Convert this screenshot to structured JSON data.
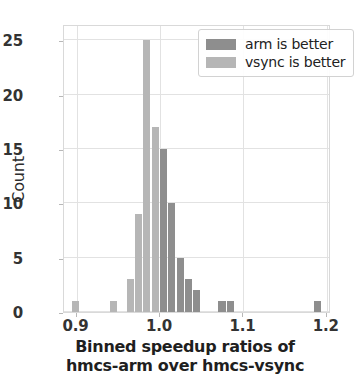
{
  "chart_data": {
    "type": "bar",
    "title": "",
    "subtitle": "",
    "xlabel_line1": "Binned speedup ratios of",
    "xlabel_line2": "hmcs-arm over hmcs-vsync",
    "ylabel": "Count",
    "xlim": [
      0.885,
      1.205
    ],
    "ylim": [
      0,
      26.5
    ],
    "xticks": [
      0.9,
      1.0,
      1.1,
      1.2
    ],
    "xtick_labels": [
      "0.9",
      "1.0",
      "1.1",
      "1.2"
    ],
    "yticks": [
      0,
      5,
      10,
      15,
      20,
      25
    ],
    "ytick_labels": [
      "0",
      "5",
      "10",
      "15",
      "20",
      "25"
    ],
    "grid": true,
    "legend_position": "upper right",
    "bin_width": 0.01,
    "threshold": 1.0,
    "series": [
      {
        "name": "vsync is better",
        "color": "#b6b6b6",
        "bins": [
          {
            "x": 0.9,
            "value": 1
          },
          {
            "x": 0.945,
            "value": 1
          },
          {
            "x": 0.965,
            "value": 3
          },
          {
            "x": 0.975,
            "value": 9
          },
          {
            "x": 0.985,
            "value": 25
          },
          {
            "x": 0.995,
            "value": 17
          }
        ]
      },
      {
        "name": "arm is better",
        "color": "#8e8e8e",
        "bins": [
          {
            "x": 1.005,
            "value": 15
          },
          {
            "x": 1.015,
            "value": 10
          },
          {
            "x": 1.025,
            "value": 5
          },
          {
            "x": 1.035,
            "value": 3
          },
          {
            "x": 1.045,
            "value": 2
          },
          {
            "x": 1.075,
            "value": 1
          },
          {
            "x": 1.085,
            "value": 1
          },
          {
            "x": 1.19,
            "value": 1
          }
        ]
      }
    ]
  },
  "legend": {
    "items": [
      {
        "label": "arm is better",
        "swatch": "arm"
      },
      {
        "label": "vsync is better",
        "swatch": "vsync"
      }
    ]
  }
}
